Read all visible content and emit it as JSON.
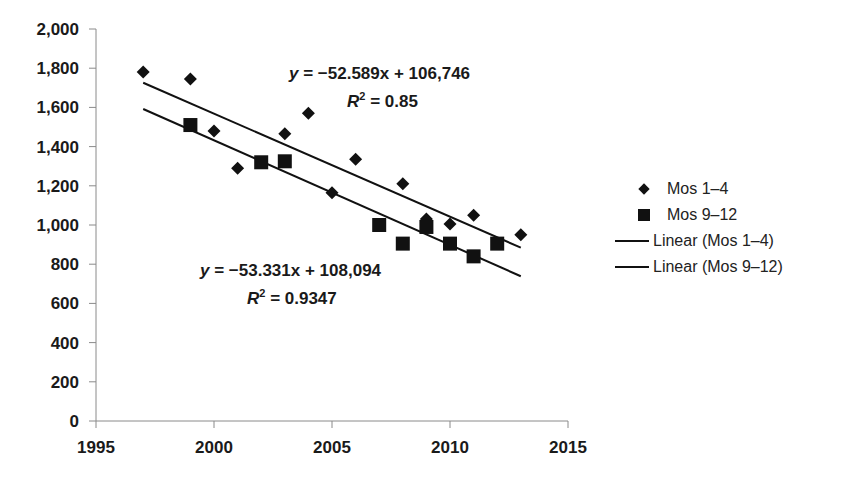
{
  "chart_data": {
    "type": "scatter",
    "title": "",
    "xlabel": "",
    "ylabel": "",
    "xlim": [
      1995,
      2015
    ],
    "ylim": [
      0,
      2000
    ],
    "x_ticks": [
      "1995",
      "2000",
      "2005",
      "2010",
      "2015"
    ],
    "y_ticks": [
      "0",
      "200",
      "400",
      "600",
      "800",
      "1,000",
      "1,200",
      "1,400",
      "1,600",
      "1,800",
      "2,000"
    ],
    "grid": false,
    "legend_position": "right",
    "series": [
      {
        "name": "Mos 1–4",
        "marker": "diamond",
        "x": [
          1997,
          1999,
          2000,
          2001,
          2003,
          2004,
          2005,
          2006,
          2008,
          2009,
          2010,
          2011,
          2013
        ],
        "y": [
          1780,
          1745,
          1480,
          1290,
          1465,
          1570,
          1165,
          1335,
          1210,
          1030,
          1005,
          1050,
          950
        ]
      },
      {
        "name": "Mos 9–12",
        "marker": "square",
        "x": [
          1999,
          2002,
          2003,
          2007,
          2008,
          2009,
          2010,
          2011,
          2012
        ],
        "y": [
          1510,
          1320,
          1325,
          1000,
          905,
          990,
          905,
          840,
          905
        ]
      },
      {
        "name": "Linear (Mos 1–4)",
        "type": "line",
        "slope": -52.589,
        "intercept": 106746,
        "x": [
          1997,
          2013
        ],
        "r2": 0.85
      },
      {
        "name": "Linear (Mos 9–12)",
        "type": "line",
        "slope": -53.331,
        "intercept": 108094,
        "x": [
          1997,
          2013
        ],
        "r2": 0.9347
      }
    ],
    "annotations": [
      {
        "text": "y = −52.589x + 106,746",
        "r2_text": "R² = 0.85"
      },
      {
        "text": "y = −53.331x + 108,094",
        "r2_text": "R² = 0.9347"
      }
    ]
  },
  "annotations": {
    "eq1": "y = −52.589x + 106,746",
    "r2_1_label": "R",
    "r2_1_value": " = 0.85",
    "eq2": "y = −53.331x + 108,094",
    "r2_2_label": "R",
    "r2_2_value": " = 0.9347",
    "sup": "2"
  },
  "legend": {
    "items": [
      {
        "label": "Mos 1–4",
        "marker": "diamond"
      },
      {
        "label": "Mos 9–12",
        "marker": "square"
      },
      {
        "label": "Linear (Mos 1–4)",
        "marker": "line"
      },
      {
        "label": "Linear (Mos 9–12)",
        "marker": "line"
      }
    ]
  },
  "caption": "… Birch City from 1997 and 2013 (partially cropped)",
  "colors": {
    "marker": "#111111",
    "axis": "#8a8a8a",
    "text": "#1a1a1a"
  }
}
